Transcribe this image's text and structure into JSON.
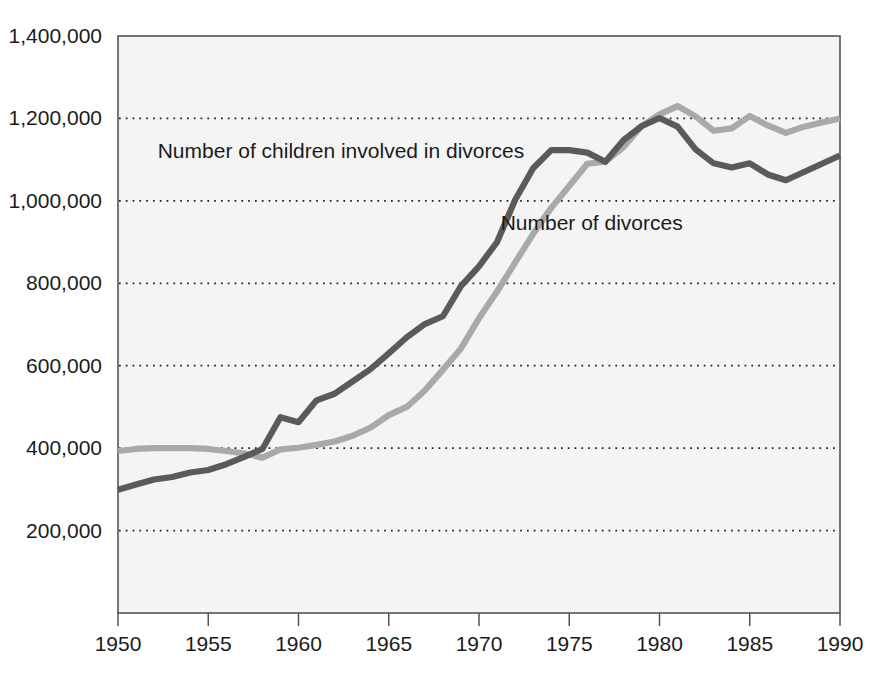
{
  "chart_data": {
    "type": "line",
    "title": "",
    "subtitle": "",
    "xlabel": "",
    "ylabel": "",
    "grid": true,
    "legend_position": "inline-annotation",
    "xlim": [
      1950,
      1990
    ],
    "ylim": [
      0,
      1400000
    ],
    "x_ticks": [
      1950,
      1955,
      1960,
      1965,
      1970,
      1975,
      1980,
      1985,
      1990
    ],
    "x_tick_labels": [
      "1950",
      "1955",
      "1960",
      "1965",
      "1970",
      "1975",
      "1980",
      "1985",
      "1990"
    ],
    "y_ticks": [
      200000,
      400000,
      600000,
      800000,
      1000000,
      1200000,
      1400000
    ],
    "y_tick_labels": [
      "200,000",
      "400,000",
      "600,000",
      "800,000",
      "1,000,000",
      "1,200,000",
      "1,400,000"
    ],
    "x": [
      1950,
      1951,
      1952,
      1953,
      1954,
      1955,
      1956,
      1957,
      1958,
      1959,
      1960,
      1961,
      1962,
      1963,
      1964,
      1965,
      1966,
      1967,
      1968,
      1969,
      1970,
      1971,
      1972,
      1973,
      1974,
      1975,
      1976,
      1977,
      1978,
      1979,
      1980,
      1981,
      1982,
      1983,
      1984,
      1985,
      1986,
      1987,
      1988,
      1989,
      1990
    ],
    "series": [
      {
        "name": "Number of children involved in divorces",
        "color": "#5a5a5a",
        "label_x": 1952.2,
        "label_y": 1105000,
        "values": [
          299000,
          312000,
          324000,
          330000,
          341000,
          347000,
          361000,
          379000,
          398000,
          475000,
          463000,
          516000,
          532000,
          562000,
          592000,
          630000,
          669000,
          701000,
          720000,
          793000,
          841000,
          900000,
          1002000,
          1079000,
          1123000,
          1123000,
          1117000,
          1095000,
          1147000,
          1181000,
          1201000,
          1180000,
          1125000,
          1091000,
          1081000,
          1091000,
          1064000,
          1050000,
          1070000,
          1090000,
          1110000
        ]
      },
      {
        "name": "Number of divorces",
        "color": "#a9a9a9",
        "label_x": 1971.2,
        "label_y": 930000,
        "values": [
          393000,
          398000,
          400000,
          400000,
          400000,
          398000,
          393000,
          387000,
          377000,
          397000,
          401000,
          408000,
          416000,
          430000,
          450000,
          480000,
          500000,
          540000,
          590000,
          642000,
          715000,
          780000,
          850000,
          920000,
          983000,
          1036000,
          1090000,
          1095000,
          1130000,
          1181000,
          1210000,
          1230000,
          1205000,
          1170000,
          1176000,
          1206000,
          1183000,
          1165000,
          1180000,
          1190000,
          1200000
        ]
      }
    ]
  },
  "axis": {
    "plot_left_px": 118,
    "plot_right_px": 840,
    "plot_top_px": 36,
    "plot_bottom_px": 613
  }
}
